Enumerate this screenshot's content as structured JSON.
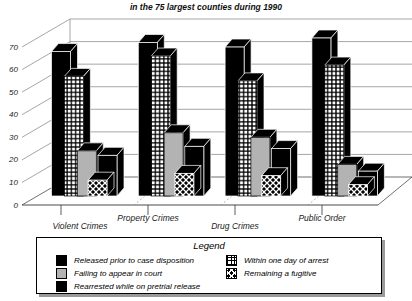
{
  "subtitle": "in the 75 largest counties during 1990",
  "chart_data": {
    "type": "bar",
    "projection": "3d",
    "subtitle": "in the 75 largest counties during 1990",
    "categories": [
      "Violent Crimes",
      "Property Crimes",
      "Drug Crimes",
      "Public Order"
    ],
    "series": [
      {
        "name": "Released prior to case disposition",
        "pattern": "solid-black",
        "values": [
          64,
          68,
          66,
          70
        ]
      },
      {
        "name": "Within one day of arrest",
        "pattern": "grid",
        "values": [
          53,
          62,
          51,
          58
        ]
      },
      {
        "name": "Failing to appear in court",
        "pattern": "solid-gray",
        "values": [
          20,
          28,
          26,
          14
        ]
      },
      {
        "name": "Remaining a fugitive",
        "pattern": "crosshatch",
        "values": [
          7,
          10,
          9,
          5
        ]
      },
      {
        "name": "Rearrested while on pretrial release",
        "pattern": "solid-black",
        "values": [
          18,
          22,
          21,
          11
        ]
      }
    ],
    "ylim": [
      0,
      70
    ],
    "ytick_step": 10,
    "yticks": [
      0,
      10,
      20,
      30,
      40,
      50,
      60,
      70
    ],
    "grid": true,
    "legend_position": "bottom"
  },
  "legend": {
    "title": "Legend",
    "columns": [
      [
        {
          "label": "Released prior to case disposition",
          "pattern": "solid-black"
        },
        {
          "label": "Failing to appear in court",
          "pattern": "solid-gray"
        },
        {
          "label": "Rearrested while on pretrial release",
          "pattern": "solid-black"
        }
      ],
      [
        {
          "label": "Within one day of arrest",
          "pattern": "grid"
        },
        {
          "label": "Remaining a fugitive",
          "pattern": "crosshatch"
        }
      ]
    ]
  },
  "colors": {
    "bar_black": "#000000",
    "bar_gray": "#b3b3b3",
    "gridline": "#8f8f8f",
    "axis": "#4a4a4a",
    "label_text": "#1c1c1c",
    "shadow": "#9a9a9a"
  }
}
